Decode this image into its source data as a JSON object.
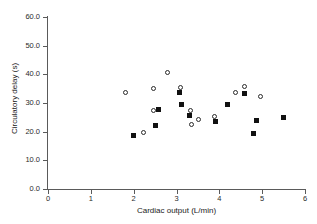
{
  "chart_data": {
    "type": "scatter",
    "title": "",
    "xlabel": "Cardiac output (L/min)",
    "ylabel": "Circulatory delay (s)",
    "xlim": [
      0,
      6
    ],
    "ylim": [
      0,
      60
    ],
    "xticks": [
      "0",
      "1",
      "2",
      "3",
      "4",
      "5",
      "6"
    ],
    "yticks": [
      "0.0",
      "10.0",
      "20.0",
      "30.0",
      "40.0",
      "50.0",
      "60.0"
    ],
    "grid": false,
    "legend": "none",
    "series": [
      {
        "name": "open-circles",
        "marker": "open-circle",
        "color": "#2a2a2a",
        "points": [
          {
            "x": 1.8,
            "y": 33.8
          },
          {
            "x": 2.23,
            "y": 19.7
          },
          {
            "x": 2.47,
            "y": 35.2
          },
          {
            "x": 2.46,
            "y": 27.5
          },
          {
            "x": 2.8,
            "y": 40.8
          },
          {
            "x": 3.1,
            "y": 35.5
          },
          {
            "x": 3.32,
            "y": 27.3
          },
          {
            "x": 3.36,
            "y": 22.6
          },
          {
            "x": 3.52,
            "y": 24.3
          },
          {
            "x": 3.88,
            "y": 25.4
          },
          {
            "x": 4.38,
            "y": 33.8
          },
          {
            "x": 4.58,
            "y": 35.9
          },
          {
            "x": 4.97,
            "y": 32.1
          }
        ]
      },
      {
        "name": "filled-squares",
        "marker": "filled-square",
        "color": "#111111",
        "points": [
          {
            "x": 2.0,
            "y": 18.5
          },
          {
            "x": 2.5,
            "y": 22.2
          },
          {
            "x": 2.58,
            "y": 27.7
          },
          {
            "x": 3.08,
            "y": 33.5
          },
          {
            "x": 3.12,
            "y": 29.4
          },
          {
            "x": 3.3,
            "y": 25.7
          },
          {
            "x": 3.9,
            "y": 23.4
          },
          {
            "x": 4.18,
            "y": 29.4
          },
          {
            "x": 4.58,
            "y": 33.2
          },
          {
            "x": 4.8,
            "y": 19.4
          },
          {
            "x": 4.86,
            "y": 23.8
          },
          {
            "x": 5.5,
            "y": 24.9
          }
        ]
      }
    ]
  }
}
